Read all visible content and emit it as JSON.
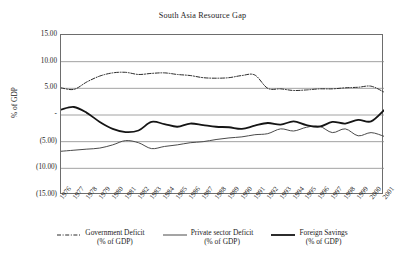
{
  "chart_data": {
    "type": "line",
    "title": "South Asia Resource Gap",
    "xlabel": "",
    "ylabel": "% of GDP",
    "ylim": [
      -15,
      15
    ],
    "yticks": [
      15,
      10,
      5,
      0,
      -5,
      -10,
      -15
    ],
    "ytick_labels": [
      "15.00",
      "10.00",
      "5.00",
      "-",
      "(5.00)",
      "(10.00)",
      "(15.00)"
    ],
    "grid": true,
    "legend_position": "bottom",
    "categories": [
      "1976",
      "1977",
      "1978",
      "1979",
      "1980",
      "1981",
      "1982",
      "1983",
      "1984",
      "1985",
      "1986",
      "1987",
      "1988",
      "1989",
      "1990",
      "1991",
      "1992",
      "1993",
      "1994",
      "1995",
      "1996",
      "1997",
      "1998",
      "1999",
      "2000",
      "2001"
    ],
    "series": [
      {
        "name": "Government Deficit",
        "sublabel": "(% of GDP)",
        "style": "dash-dot",
        "color": "#2a2a2a",
        "width": 1,
        "values": [
          5.1,
          4.8,
          6.2,
          7.3,
          7.9,
          8.0,
          7.6,
          7.8,
          7.9,
          7.6,
          7.4,
          7.0,
          6.9,
          7.0,
          7.4,
          7.5,
          5.0,
          4.9,
          4.6,
          4.7,
          4.9,
          4.9,
          5.1,
          5.2,
          5.4,
          4.3
        ]
      },
      {
        "name": "Private sector Deficit",
        "sublabel": "(% of GDP)",
        "style": "solid",
        "color": "#4a4a4a",
        "width": 1,
        "values": [
          -6.8,
          -6.6,
          -6.4,
          -6.2,
          -5.6,
          -4.8,
          -5.2,
          -6.3,
          -5.9,
          -5.6,
          -5.2,
          -5.0,
          -4.6,
          -4.3,
          -4.1,
          -3.7,
          -3.5,
          -2.6,
          -3.0,
          -2.3,
          -2.1,
          -3.3,
          -2.6,
          -3.9,
          -3.3,
          -4.0
        ]
      },
      {
        "name": "Foreign Savings",
        "sublabel": "(% of GDP)",
        "style": "solid",
        "color": "#151515",
        "width": 1.8,
        "values": [
          1.0,
          1.5,
          0.4,
          -1.3,
          -2.6,
          -3.2,
          -2.9,
          -1.3,
          -1.7,
          -2.2,
          -1.6,
          -1.9,
          -2.2,
          -2.3,
          -2.6,
          -2.0,
          -1.5,
          -1.8,
          -1.2,
          -1.9,
          -2.2,
          -1.3,
          -1.6,
          -0.9,
          -1.2,
          0.9
        ]
      }
    ]
  }
}
